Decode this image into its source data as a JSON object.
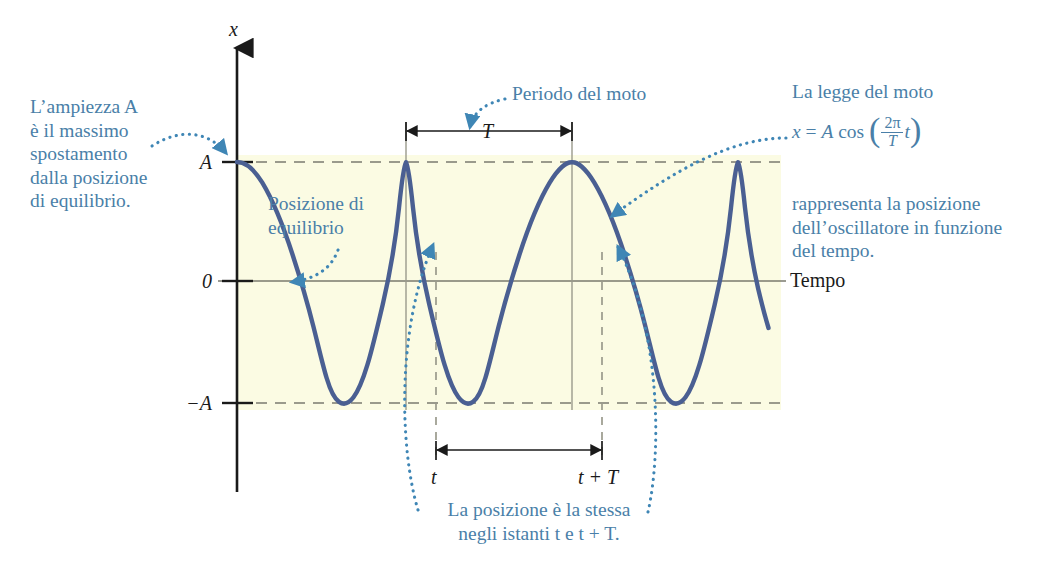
{
  "figure": {
    "type": "physics-diagram",
    "colors": {
      "annotation_blue": "#4a7fa8",
      "curve_blue": "#4a5f92",
      "band_yellow": "#fbfbe3",
      "axis_black": "#1a1a1a",
      "dashed_gray": "#8c8c80",
      "time_axis_gray": "#7a7a6e"
    }
  },
  "axes": {
    "vertical_label": "x",
    "horizontal_label": "Tempo",
    "ticks": [
      {
        "label": "A",
        "value": 1
      },
      {
        "label": "0",
        "value": 0
      },
      {
        "label": "−A",
        "value": -1
      }
    ]
  },
  "measures": {
    "period_label": "T",
    "t_label": "t",
    "t_plus_T_label": "t + T"
  },
  "annotations": {
    "amplitude": "L’ampiezza A\nè il massimo\nspostamento\ndalla posizione\ndi equilibrio.",
    "equilibrium": "Posizione di\nequilibrio",
    "period": "Periodo del moto",
    "law_intro": "La legge del moto",
    "law_outro": "rappresenta la posizione\ndell’oscillatore in funzione\ndel tempo.",
    "same_position": "La posizione è la stessa\nnegli istanti t e t + T."
  },
  "equation": {
    "lhs": "x",
    "equals": "=",
    "amplitude": "A",
    "function": "cos",
    "numerator": "2π",
    "denominator": "T",
    "variable": "t"
  },
  "chart_data": {
    "type": "line",
    "xlabel": "Tempo",
    "ylabel": "x",
    "function": "x = A cos(2πt/T)",
    "amplitude": 1,
    "period": 1,
    "ylim": [
      -1.35,
      1.35
    ],
    "xlim": [
      0,
      3.28
    ],
    "grid": false,
    "yticks": [
      -1,
      0,
      1
    ],
    "ytick_labels": [
      "−A",
      "0",
      "A"
    ],
    "markers": [
      {
        "name": "t",
        "x": 0.33
      },
      {
        "name": "t + T",
        "x": 1.33
      }
    ]
  }
}
